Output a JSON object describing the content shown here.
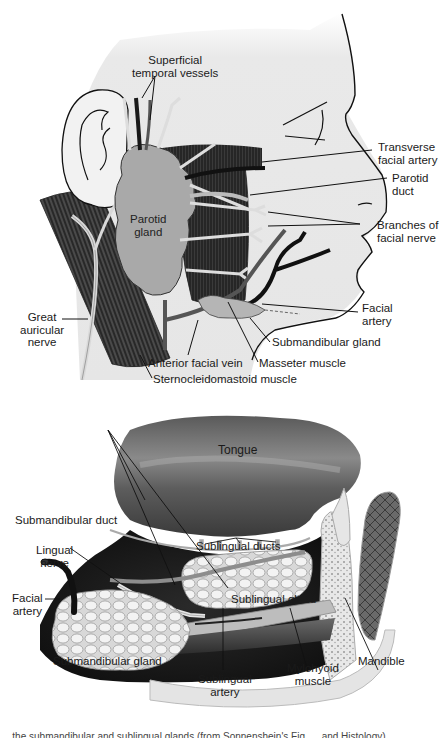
{
  "figure_top": {
    "title": "Parotid region (lateral view of face)",
    "labels": {
      "superficial_temporal": "Superficial\ntemporal vessels",
      "transverse_facial_artery": "Transverse\nfacial artery",
      "parotid_duct": "Parotid\nduct",
      "parotid_gland": "Parotid\ngland",
      "branches_facial_nerve": "Branches of\nfacial nerve",
      "facial_artery": "Facial\nartery",
      "great_auricular_nerve": "Great\nauricular\nnerve",
      "submandibular_gland": "Submandibular gland",
      "anterior_facial_vein": "Anterior facial vein",
      "masseter_muscle": "Masseter muscle",
      "sternocleidomastoid": "Sternocleidomastoid muscle"
    }
  },
  "figure_bottom": {
    "title": "Floor of mouth (sublingual and submandibular glands)",
    "labels": {
      "tongue": "Tongue",
      "submandibular_duct": "Submandibular duct",
      "sublingual_ducts": "Sublingual ducts",
      "lingual_nerve": "Lingual\nnerve",
      "facial_artery": "Facial\nartery",
      "sublingual_gland": "Sublingual gland",
      "submandibular_gland": "Submandibular gland",
      "mandible": "Mandible",
      "sublingual_artery": "Sublingual\nartery",
      "mylohyoid_muscle": "Mylohyoid\nmuscle"
    }
  },
  "caption": "...the submandibular and sublingual glands (from Sonnenshein's Fig. ... and Histology)"
}
